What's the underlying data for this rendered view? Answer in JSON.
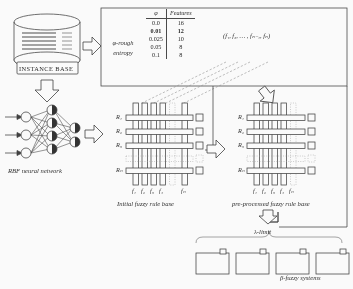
{
  "diagram": {
    "ink_color": "#2b2b2b"
  },
  "database": {
    "label": "INSTANCE BASE",
    "icon": "cylinder-database-icon"
  },
  "network": {
    "caption": "RBF neural network",
    "icon": "neural-network-icon"
  },
  "entropy_box": {
    "method_label_line1": "φ-rough",
    "method_label_line2": "entropy",
    "table": {
      "headers": [
        "φ",
        "Features"
      ],
      "rows": [
        {
          "phi": "0.0",
          "features": "16",
          "bold": false
        },
        {
          "phi": "0.01",
          "features": "12",
          "bold": true
        },
        {
          "phi": "0.025",
          "features": "10",
          "bold": false
        },
        {
          "phi": "0.05",
          "features": "8",
          "bold": false
        },
        {
          "phi": "0.1",
          "features": "8",
          "bold": false
        }
      ]
    },
    "feature_set": "(f₁, f₂,  …  , fₙ₋₁, fₙ)"
  },
  "initial_rule_base": {
    "caption": "Initial fuzzy rule base",
    "row_labels": [
      "R₁",
      "R₂",
      "R₃",
      "Rₙ"
    ],
    "col_labels": [
      "f₁",
      "f₂",
      "f₃",
      "f₄",
      "fₙ"
    ]
  },
  "preprocessed_rule_base": {
    "caption": "pre-processed fuzzy rule base",
    "row_labels": [
      "R₁",
      "R₂",
      "R₃",
      "Rₙ"
    ],
    "col_labels": [
      "f₁",
      "f₂",
      "f₃",
      "f₄",
      "fₙ"
    ]
  },
  "output": {
    "limit_label": "λ-limit",
    "systems_label": "β-fuzzy systems",
    "system_count": 4
  }
}
